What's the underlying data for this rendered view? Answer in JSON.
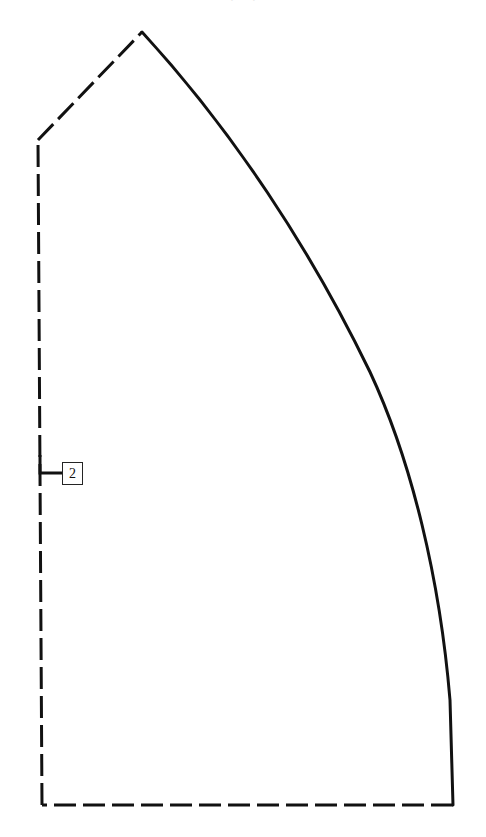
{
  "figure": {
    "type": "technical-line-drawing",
    "width": 486,
    "height": 837,
    "background_color": "#ffffff",
    "stroke_color": "#111111",
    "top_text_fragment": "(. . .)"
  },
  "geometry": {
    "apex": {
      "x": 142,
      "y": 32
    },
    "upper_left_vertex": {
      "x": 38,
      "y": 140
    },
    "bottom_left_corner": {
      "x": 42,
      "y": 805
    },
    "bottom_right_corner": {
      "x": 453,
      "y": 805
    },
    "stroke_width": 3,
    "dash_pattern": "22 7",
    "curve_path": "M 142 32 C 232 130, 310 248, 370 372 C 412 462, 440 580, 450 700 L 453 805",
    "dashed_bottom_path": "M 453 805 L 42 805",
    "dashed_left_path": "M 42 805 L 38 140",
    "dashed_diagonal_path": "M 38 140 L 142 32"
  },
  "callouts": [
    {
      "label": "2",
      "box": {
        "x": 62,
        "y": 462,
        "width": 21,
        "height": 23
      },
      "leader_path": "M 40 455 L 40 473 L 62 473",
      "leader_stroke_width": 3
    }
  ]
}
